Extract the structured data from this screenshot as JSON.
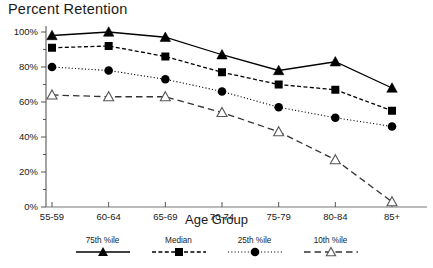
{
  "chart_data": {
    "type": "line",
    "title": "Percent Retention",
    "xlabel": "Age Group",
    "ylabel": "",
    "categories": [
      "55-59",
      "60-64",
      "65-69",
      "70-74",
      "75-79",
      "80-84",
      "85+"
    ],
    "ylim": [
      0,
      100
    ],
    "yticks": [
      0,
      20,
      40,
      60,
      80,
      100
    ],
    "ytick_labels": [
      "0%",
      "20%",
      "40%",
      "60%",
      "80%",
      "100%"
    ],
    "y_minor_ticks": [
      10,
      30,
      50,
      70,
      90
    ],
    "grid": false,
    "legend_position": "bottom",
    "series": [
      {
        "name": "75th %ile",
        "marker": "filled-triangle",
        "line_style": "solid",
        "color": "#000000",
        "values": [
          98,
          100,
          97,
          87,
          78,
          83,
          68
        ]
      },
      {
        "name": "Median",
        "marker": "filled-square",
        "line_style": "dashed-fine",
        "color": "#000000",
        "values": [
          91,
          92,
          86,
          77,
          70,
          67,
          55
        ]
      },
      {
        "name": "25th %ile",
        "marker": "filled-circle",
        "line_style": "dotted",
        "color": "#000000",
        "values": [
          80,
          78,
          73,
          66,
          57,
          51,
          46
        ]
      },
      {
        "name": "10th %ile",
        "marker": "open-triangle",
        "line_style": "dashed",
        "color": "#000000",
        "values": [
          64,
          63,
          63,
          54,
          43,
          27,
          3
        ]
      }
    ]
  },
  "legend": {
    "items": [
      {
        "label": "75th %ile",
        "marker": "filled-triangle",
        "line_style": "solid"
      },
      {
        "label": "Median",
        "marker": "filled-square",
        "line_style": "dashed-fine"
      },
      {
        "label": "25th %ile",
        "marker": "filled-circle",
        "line_style": "dotted"
      },
      {
        "label": "10th %ile",
        "marker": "open-triangle",
        "line_style": "dashed"
      }
    ]
  }
}
